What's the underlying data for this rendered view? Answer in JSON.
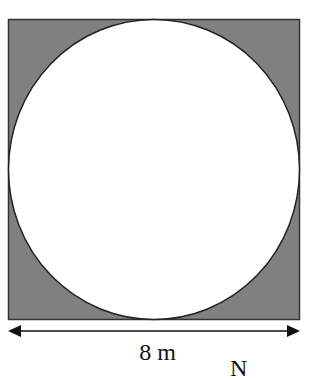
{
  "diagram": {
    "type": "square-with-inscribed-circle",
    "square": {
      "side_label": "8 m",
      "fill": "#7f7f7f",
      "stroke": "#333333"
    },
    "circle": {
      "fill": "#ffffff",
      "stroke": "#222222",
      "inscribed": true
    },
    "dimension": {
      "label": "8 m",
      "arrow": "double-headed"
    },
    "clipped_text": "N"
  }
}
